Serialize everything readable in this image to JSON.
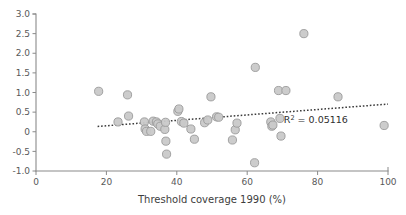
{
  "chart_data": {
    "type": "scatter",
    "title": "",
    "subtitle": "",
    "xlabel": "Threshold coverage 1990 (%)",
    "ylabel": "",
    "xlim": [
      0,
      100
    ],
    "ylim": [
      -1.0,
      3.0
    ],
    "xticks": [
      0,
      20,
      40,
      60,
      80,
      100
    ],
    "xtick_labels": [
      "0",
      "20",
      "40",
      "60",
      "80",
      "100"
    ],
    "yticks": [
      -1.0,
      -0.5,
      0,
      0.5,
      1.0,
      1.5,
      2.0,
      2.5,
      3.0
    ],
    "ytick_labels": [
      "-1.0",
      "-0.5",
      "0",
      "0.5",
      "1.0",
      "1.5",
      "2.0",
      "2.5",
      "3.0"
    ],
    "grid": false,
    "legend": null,
    "marker_color": "#c9c9c9",
    "marker_edge_color": "#9a9a9a",
    "trendline_color": "#3a3a3a",
    "trendline_style": "dotted",
    "trendline": {
      "x_start": 17.5,
      "y_start": 0.135,
      "x_end": 100.0,
      "y_end": 0.705
    },
    "annotations": [
      {
        "name": "r-squared",
        "text_prefix": "R",
        "text_sup": "2",
        "text_suffix": " = 0.05116",
        "x": 79.5,
        "y": 0.23
      }
    ],
    "points": [
      {
        "x": 17.8,
        "y": 1.03
      },
      {
        "x": 23.3,
        "y": 0.25
      },
      {
        "x": 26.0,
        "y": 0.94
      },
      {
        "x": 26.3,
        "y": 0.4
      },
      {
        "x": 30.8,
        "y": 0.25
      },
      {
        "x": 31.0,
        "y": 0.07
      },
      {
        "x": 31.4,
        "y": 0.01
      },
      {
        "x": 32.6,
        "y": 0.01
      },
      {
        "x": 33.3,
        "y": 0.27
      },
      {
        "x": 34.2,
        "y": 0.25
      },
      {
        "x": 34.6,
        "y": 0.2
      },
      {
        "x": 35.3,
        "y": 0.14
      },
      {
        "x": 36.6,
        "y": 0.06
      },
      {
        "x": 36.8,
        "y": 0.24
      },
      {
        "x": 36.9,
        "y": -0.24
      },
      {
        "x": 37.1,
        "y": -0.57
      },
      {
        "x": 40.3,
        "y": 0.52
      },
      {
        "x": 40.6,
        "y": 0.58
      },
      {
        "x": 41.3,
        "y": 0.26
      },
      {
        "x": 42.0,
        "y": 0.22
      },
      {
        "x": 44.0,
        "y": 0.07
      },
      {
        "x": 45.0,
        "y": -0.19
      },
      {
        "x": 47.9,
        "y": 0.23
      },
      {
        "x": 48.8,
        "y": 0.3
      },
      {
        "x": 49.7,
        "y": 0.89
      },
      {
        "x": 51.3,
        "y": 0.38
      },
      {
        "x": 51.9,
        "y": 0.37
      },
      {
        "x": 55.8,
        "y": -0.21
      },
      {
        "x": 56.6,
        "y": 0.05
      },
      {
        "x": 57.1,
        "y": 0.22
      },
      {
        "x": 62.3,
        "y": 1.64
      },
      {
        "x": 62.1,
        "y": -0.79
      },
      {
        "x": 66.7,
        "y": 0.25
      },
      {
        "x": 67.0,
        "y": 0.14
      },
      {
        "x": 67.3,
        "y": 0.17
      },
      {
        "x": 68.9,
        "y": 1.05
      },
      {
        "x": 69.3,
        "y": 0.34
      },
      {
        "x": 69.6,
        "y": -0.11
      },
      {
        "x": 71.0,
        "y": 1.05
      },
      {
        "x": 76.1,
        "y": 2.5
      },
      {
        "x": 85.8,
        "y": 0.89
      },
      {
        "x": 98.9,
        "y": 0.16
      }
    ]
  },
  "axis": {
    "x_title": "Threshold coverage 1990 (%)"
  }
}
